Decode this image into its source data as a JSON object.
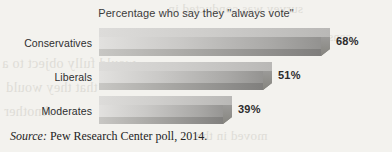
{
  "chart_data": {
    "type": "bar",
    "orientation": "horizontal",
    "title": "Percentage who say they \"always vote\"",
    "xlabel": "",
    "ylabel": "",
    "xlim": [
      0,
      100
    ],
    "grid": false,
    "legend": "none",
    "categories": [
      "Conservatives",
      "Liberals",
      "Moderates"
    ],
    "values": [
      68,
      51,
      39
    ],
    "value_labels": [
      "68%",
      "51%",
      "39%"
    ],
    "source": {
      "prefix": "Source:",
      "text": "Pew Research Center poll, 2014."
    }
  },
  "colors": {
    "page_background": "#f3f2ee",
    "bar_light": "#e2e1df",
    "bar_dark": "#8f8e8c",
    "bar_base": "#7c7b79",
    "text": "#2c2c2c",
    "ghost_text": "#d8d6d0"
  },
  "background_ghost_text": {
    "line1": "survey was conducted in",
    "line2": "would fully object to a",
    "line3": "that they would",
    "line4": "Another",
    "line5": "moved in the",
    "line6": "consensus"
  }
}
